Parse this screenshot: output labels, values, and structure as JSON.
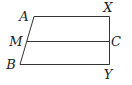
{
  "diagram": {
    "type": "geometry-figure",
    "points": {
      "A": {
        "label": "A",
        "x": 34,
        "y": 16,
        "lx": 24,
        "ly": 21
      },
      "X": {
        "label": "X",
        "x": 109,
        "y": 16,
        "lx": 108,
        "ly": 11
      },
      "M": {
        "label": "M",
        "x": 27,
        "y": 41,
        "lx": 16,
        "ly": 46
      },
      "C": {
        "label": "C",
        "x": 109,
        "y": 41,
        "lx": 116,
        "ly": 46
      },
      "B": {
        "label": "B",
        "x": 20,
        "y": 64,
        "lx": 12,
        "ly": 69
      },
      "Y": {
        "label": "Y",
        "x": 109,
        "y": 64,
        "lx": 108,
        "ly": 79
      }
    },
    "segments": [
      {
        "from": "A",
        "to": "X"
      },
      {
        "from": "X",
        "to": "Y"
      },
      {
        "from": "Y",
        "to": "B"
      },
      {
        "from": "B",
        "to": "A"
      },
      {
        "from": "M",
        "to": "C"
      }
    ],
    "colors": {
      "line": "#333333",
      "text": "#222222",
      "background": "#ffffff"
    }
  }
}
